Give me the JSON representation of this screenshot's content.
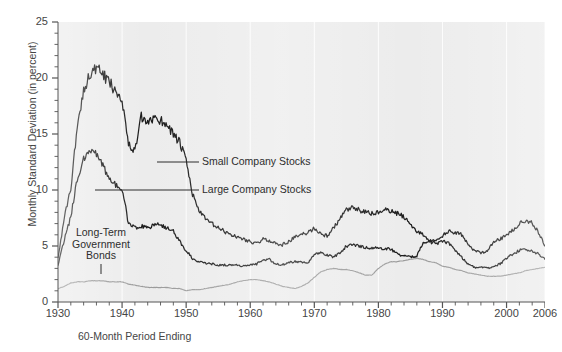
{
  "figure": {
    "clipped_top_text": "",
    "x_axis_title": "60-Month Period Ending",
    "y_axis_title": "Monthly Standard Deviation (in percent)"
  },
  "annotations": {
    "small": "Small Company Stocks",
    "large": "Large Company Stocks",
    "bonds_line1": "Long-Term",
    "bonds_line2": "Government",
    "bonds_line3": "Bonds"
  },
  "colors": {
    "plot_background": "#ececec",
    "gridline": "#ffffff",
    "axis": "#555555",
    "small_company": "#1a1a1a",
    "large_company": "#1a1a1a",
    "bonds": "#9a9a9a",
    "text": "#454545"
  },
  "chart_data": {
    "type": "line",
    "title": "",
    "xlabel": "60-Month Period Ending",
    "ylabel": "Monthly Standard Deviation (in percent)",
    "xlim": [
      1930,
      2006
    ],
    "ylim": [
      0,
      25
    ],
    "yticks": [
      0,
      5,
      10,
      15,
      20,
      25
    ],
    "xticks": [
      1930,
      1940,
      1950,
      1960,
      1970,
      1980,
      1990,
      2000,
      2006
    ],
    "x_minor_tick_interval": 2,
    "y_minor_tick_interval": 1,
    "grid": "vertical white gridlines at decade ticks",
    "legend": "inline annotations with leader lines",
    "x": [
      1930,
      1931,
      1932,
      1933,
      1934,
      1935,
      1936,
      1937,
      1938,
      1939,
      1940,
      1941,
      1942,
      1943,
      1944,
      1945,
      1946,
      1947,
      1948,
      1949,
      1950,
      1951,
      1952,
      1953,
      1954,
      1955,
      1956,
      1957,
      1958,
      1959,
      1960,
      1961,
      1962,
      1963,
      1964,
      1965,
      1966,
      1967,
      1968,
      1969,
      1970,
      1971,
      1972,
      1973,
      1974,
      1975,
      1976,
      1977,
      1978,
      1979,
      1980,
      1981,
      1982,
      1983,
      1984,
      1985,
      1986,
      1987,
      1988,
      1989,
      1990,
      1991,
      1992,
      1993,
      1994,
      1995,
      1996,
      1997,
      1998,
      1999,
      2000,
      2001,
      2002,
      2003,
      2004,
      2005,
      2006
    ],
    "series": [
      {
        "name": "Small Company Stocks",
        "color": "#1a1a1a",
        "values": [
          4.0,
          7.5,
          10.2,
          15.5,
          19.0,
          20.4,
          20.8,
          20.3,
          19.6,
          18.9,
          18.2,
          14.0,
          13.5,
          16.5,
          15.8,
          16.6,
          16.2,
          15.9,
          15.0,
          14.2,
          12.6,
          9.6,
          8.2,
          7.4,
          7.0,
          6.6,
          6.3,
          6.0,
          5.8,
          5.6,
          5.4,
          5.2,
          5.6,
          5.5,
          5.2,
          5.1,
          5.4,
          5.8,
          6.0,
          6.2,
          6.6,
          6.1,
          5.9,
          6.6,
          7.4,
          8.2,
          8.4,
          8.2,
          8.0,
          7.9,
          8.0,
          8.2,
          8.1,
          7.9,
          7.6,
          7.0,
          6.3,
          6.0,
          5.5,
          5.4,
          5.9,
          6.3,
          6.2,
          6.0,
          5.1,
          4.6,
          4.4,
          4.6,
          5.4,
          5.6,
          6.0,
          6.4,
          7.0,
          7.2,
          7.1,
          6.2,
          5.0
        ]
      },
      {
        "name": "Large Company Stocks",
        "color": "#1a1a1a",
        "values": [
          3.3,
          5.6,
          7.6,
          11.0,
          12.8,
          13.4,
          13.3,
          12.2,
          11.0,
          10.5,
          10.2,
          7.0,
          6.6,
          6.8,
          6.6,
          6.9,
          6.9,
          6.6,
          6.3,
          5.4,
          4.6,
          3.9,
          3.6,
          3.5,
          3.4,
          3.3,
          3.3,
          3.3,
          3.3,
          3.2,
          3.3,
          3.4,
          3.8,
          3.8,
          3.4,
          3.3,
          3.5,
          3.6,
          3.6,
          3.5,
          4.2,
          4.4,
          4.2,
          4.0,
          4.4,
          5.0,
          5.1,
          5.0,
          4.9,
          4.8,
          4.8,
          4.8,
          4.7,
          4.3,
          4.1,
          4.0,
          4.1,
          5.4,
          5.4,
          5.2,
          5.4,
          5.3,
          4.6,
          4.0,
          3.4,
          3.1,
          3.1,
          3.0,
          3.2,
          3.4,
          3.9,
          4.3,
          4.6,
          4.7,
          4.5,
          4.3,
          3.8
        ]
      },
      {
        "name": "Long-Term Government Bonds",
        "color": "#9a9a9a",
        "values": [
          1.2,
          1.4,
          1.7,
          1.8,
          1.8,
          1.9,
          1.9,
          1.9,
          1.8,
          1.8,
          1.8,
          1.6,
          1.5,
          1.4,
          1.3,
          1.3,
          1.3,
          1.3,
          1.2,
          1.2,
          1.0,
          1.1,
          1.1,
          1.2,
          1.3,
          1.4,
          1.5,
          1.6,
          1.8,
          1.9,
          2.0,
          2.0,
          1.9,
          1.8,
          1.6,
          1.4,
          1.3,
          1.2,
          1.4,
          1.7,
          2.2,
          2.7,
          2.9,
          3.0,
          2.9,
          2.9,
          2.8,
          2.6,
          2.4,
          2.4,
          3.0,
          3.4,
          3.6,
          3.6,
          3.7,
          3.8,
          3.9,
          3.8,
          3.6,
          3.5,
          3.2,
          3.1,
          2.9,
          2.8,
          2.6,
          2.5,
          2.4,
          2.3,
          2.3,
          2.3,
          2.4,
          2.5,
          2.6,
          2.8,
          2.9,
          3.0,
          3.1
        ]
      }
    ]
  }
}
